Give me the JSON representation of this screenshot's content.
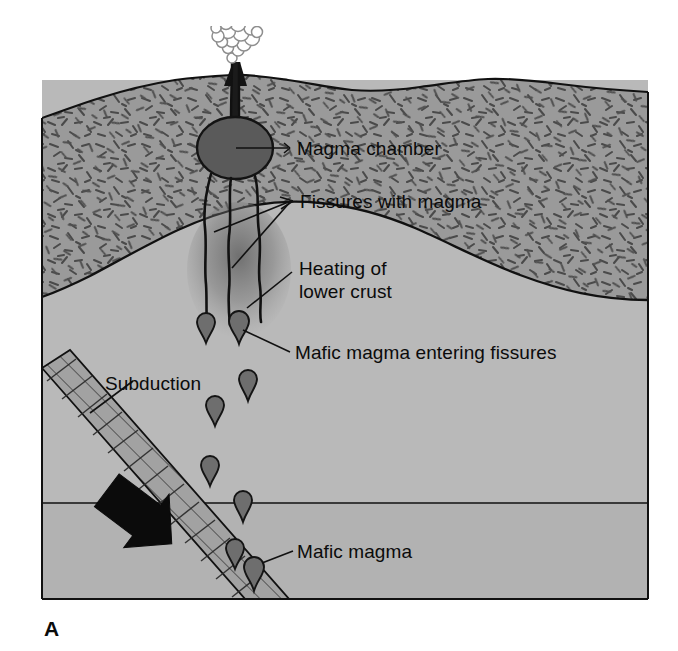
{
  "figure": {
    "panel_letter": "A",
    "title_alt": "Subduction-zone volcanism cross section",
    "type": "geologic-cross-section"
  },
  "labels": {
    "magma_chamber": "Magma chamber",
    "fissures_with_magma": "Fissures with magma",
    "heating_line1": "Heating of",
    "heating_line2": "lower crust",
    "mafic_entering": "Mafic magma entering fissures",
    "subduction": "Subduction",
    "mafic_magma": "Mafic magma"
  },
  "colors": {
    "upper_crust": "#9a9a9a",
    "upper_crust_stipple": "#4a4a4a",
    "mantle_upper": "#b9b9b9",
    "mantle_lower": "#b2b2b2",
    "magma_chamber": "#5a5a5a",
    "magma_droplet": "#6e6e6e",
    "slab_fill": "#a2a2a2",
    "slab_hatch": "#3c3c3c",
    "arrow": "#0b0b0b",
    "plume_fill": "#ffffff",
    "plume_stroke": "#8c8c8c",
    "outline": "#111111",
    "text": "#0b0b0b",
    "background": "#ffffff"
  },
  "elements": {
    "volcano_plume": "eruption-cloud",
    "volcanic_vent": "vent-conduit",
    "magma_chamber_shape": "ellipse",
    "fissure_count": 3,
    "droplet_count": 9,
    "subduction_arrow": "thick-black-arrow-down-right",
    "slab_style": "hatched-band"
  },
  "layers": [
    {
      "name": "Upper crust",
      "pattern": "dash-stipple"
    },
    {
      "name": "Lower crust / mantle",
      "pattern": "plain"
    },
    {
      "name": "Deeper mantle",
      "pattern": "plain"
    }
  ]
}
